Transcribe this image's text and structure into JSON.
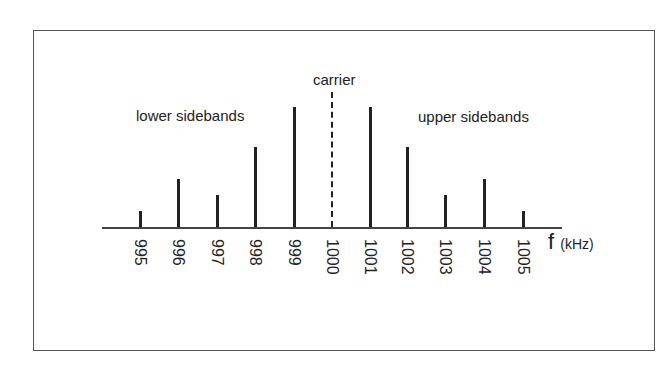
{
  "chart_data": {
    "type": "bar",
    "title": "",
    "xlabel": "f (kHz)",
    "ylabel": "",
    "categories": [
      "995",
      "996",
      "997",
      "998",
      "999",
      "1000",
      "1001",
      "1002",
      "1003",
      "1004",
      "1005"
    ],
    "values": [
      16,
      48,
      32,
      80,
      120,
      135,
      120,
      80,
      32,
      48,
      16
    ],
    "annotations": [
      "carrier",
      "lower sidebands",
      "upper sidebands"
    ],
    "carrier_index": 5,
    "carrier_style": "dash-dot",
    "grid": false,
    "legend": "none"
  },
  "labels": {
    "carrier": "carrier",
    "lower": "lower sidebands",
    "upper": "upper sidebands",
    "f": "f",
    "unit": "(kHz)"
  },
  "layout": {
    "axis_y": 227,
    "axis_x0": 102,
    "axis_x1": 562,
    "x_positions": [
      140,
      178,
      217,
      255,
      294,
      332,
      370,
      407,
      445,
      484,
      523
    ]
  }
}
